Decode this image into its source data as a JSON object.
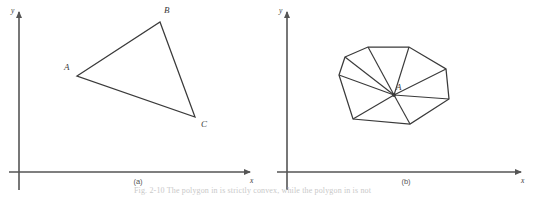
{
  "figure": {
    "background_color": "#ffffff",
    "stroke_color": "#3a3a3a",
    "axis_color": "#555555",
    "panels": [
      {
        "id": "panel-a",
        "caption": "(a)",
        "caption_pos": {
          "x": 138,
          "y": 184
        },
        "axes": {
          "x_label": "x",
          "y_label": "y",
          "x_label_pos": {
            "x": 250,
            "y": 183
          },
          "y_label_pos": {
            "x": 11,
            "y": 13
          },
          "origin": {
            "x": 19,
            "y": 172
          },
          "x_start": {
            "x": 9,
            "y": 172
          },
          "x_end": {
            "x": 256,
            "y": 172
          },
          "y_start": {
            "x": 19,
            "y": 190
          },
          "y_end": {
            "x": 19,
            "y": 7
          }
        },
        "shape": {
          "type": "triangle",
          "vertices": [
            {
              "label": "A",
              "x": 77,
              "y": 76,
              "label_x": 64,
              "label_y": 70
            },
            {
              "label": "B",
              "x": 160,
              "y": 22,
              "label_x": 164,
              "label_y": 13
            },
            {
              "label": "C",
              "x": 195,
              "y": 117,
              "label_x": 201,
              "label_y": 127
            }
          ],
          "interior_edges": []
        }
      },
      {
        "id": "panel-b",
        "caption": "(b)",
        "caption_pos": {
          "x": 406,
          "y": 184
        },
        "axes": {
          "x_label": "x",
          "y_label": "y",
          "x_label_pos": {
            "x": 521,
            "y": 183
          },
          "y_label_pos": {
            "x": 279,
            "y": 13
          },
          "origin": {
            "x": 287,
            "y": 172
          },
          "x_start": {
            "x": 277,
            "y": 172
          },
          "x_end": {
            "x": 527,
            "y": 172
          },
          "y_start": {
            "x": 287,
            "y": 190
          },
          "y_end": {
            "x": 287,
            "y": 7
          }
        },
        "shape": {
          "type": "octagon-fan",
          "center": {
            "label": "A",
            "x": 394,
            "y": 95,
            "label_x": 396,
            "label_y": 90
          },
          "vertices": [
            {
              "x": 345,
              "y": 57
            },
            {
              "x": 368,
              "y": 47
            },
            {
              "x": 409,
              "y": 47
            },
            {
              "x": 446,
              "y": 69
            },
            {
              "x": 449,
              "y": 99
            },
            {
              "x": 410,
              "y": 124
            },
            {
              "x": 353,
              "y": 119
            },
            {
              "x": 339,
              "y": 75
            }
          ]
        }
      }
    ],
    "bottom_caption_fragment": "Fig. 2-10   The polygon in          is strictly convex, while the polygon in           is not"
  }
}
